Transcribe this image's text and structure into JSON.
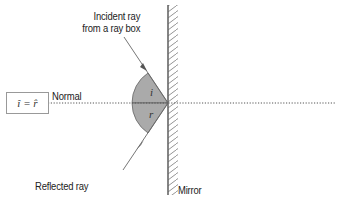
{
  "diagram": {
    "labels": {
      "incident": [
        "Incident ray",
        "from a ray box"
      ],
      "normal": "Normal",
      "reflected": "Reflected ray",
      "mirror": "Mirror",
      "angle_i": "i",
      "angle_r": "r",
      "equation": "î = r̂"
    },
    "colors": {
      "line": "#555555",
      "sector_fill": "#aaaaaa",
      "mirror": "#666666",
      "text": "#222222"
    }
  }
}
